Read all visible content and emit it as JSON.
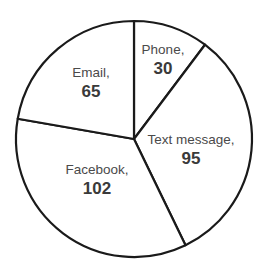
{
  "chart_data": {
    "type": "pie",
    "title": "",
    "start_angle_deg": 0,
    "direction": "clockwise",
    "slices": [
      {
        "label": "Phone",
        "display": "Phone,",
        "value": 30
      },
      {
        "label": "Text message",
        "display": "Text message,",
        "value": 95
      },
      {
        "label": "Facebook",
        "display": "Facebook,",
        "value": 102
      },
      {
        "label": "Email",
        "display": "Email,",
        "value": 65
      }
    ],
    "categories": [
      "Phone",
      "Text message",
      "Facebook",
      "Email"
    ],
    "values": [
      30,
      95,
      102,
      65
    ],
    "total": 292,
    "fill_color": "#ffffff",
    "stroke_color": "#1a1a1a",
    "legend": "none (inline labels)"
  },
  "labels": {
    "phone": {
      "name": "Phone,",
      "value": "30"
    },
    "text_message": {
      "name": "Text message,",
      "value": "95"
    },
    "facebook": {
      "name": "Facebook,",
      "value": "102"
    },
    "email": {
      "name": "Email,",
      "value": "65"
    }
  }
}
